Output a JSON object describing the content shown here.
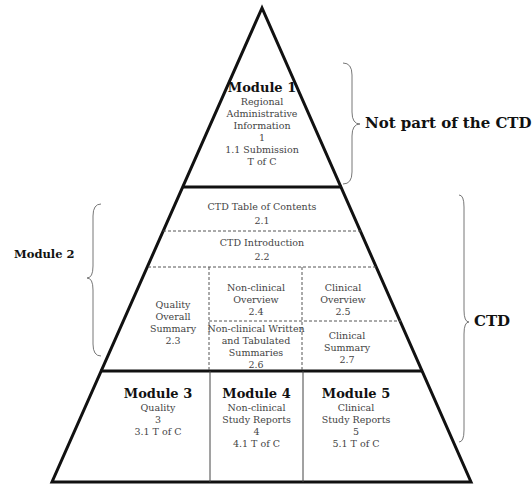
{
  "module1": {
    "title": "Module 1",
    "lines": [
      "Regional",
      "Administrative",
      "Information",
      "1",
      "1.1 Submission",
      "T of C"
    ]
  },
  "module2": {
    "label": "Module 2",
    "toc": {
      "name": "CTD Table of Contents",
      "num": "2.1"
    },
    "intro": {
      "name": "CTD Introduction",
      "num": "2.2"
    },
    "qos": {
      "lines": [
        "Quality",
        "Overall",
        "Summary",
        "2.3"
      ]
    },
    "nc_overview": {
      "lines": [
        "Non-clinical",
        "Overview",
        "2.4"
      ]
    },
    "c_overview": {
      "lines": [
        "Clinical",
        "Overview",
        "2.5"
      ]
    },
    "nc_summaries": {
      "lines": [
        "Non-clinical Written",
        "and Tabulated",
        "Summaries",
        "2.6"
      ]
    },
    "c_summary": {
      "lines": [
        "Clinical",
        "Summary",
        "2.7"
      ]
    }
  },
  "module3": {
    "title": "Module 3",
    "lines": [
      "Quality",
      "3",
      "3.1 T of C"
    ]
  },
  "module4": {
    "title": "Module 4",
    "lines": [
      "Non-clinical",
      "Study Reports",
      "4",
      "4.1 T of C"
    ]
  },
  "module5": {
    "title": "Module 5",
    "lines": [
      "Clinical",
      "Study Reports",
      "5",
      "5.1 T of C"
    ]
  },
  "annotations": {
    "not_ctd": "Not part of the CTD",
    "ctd": "CTD"
  },
  "colors": {
    "outline": "#111111",
    "dash": "#555555",
    "brace": "#777777"
  }
}
